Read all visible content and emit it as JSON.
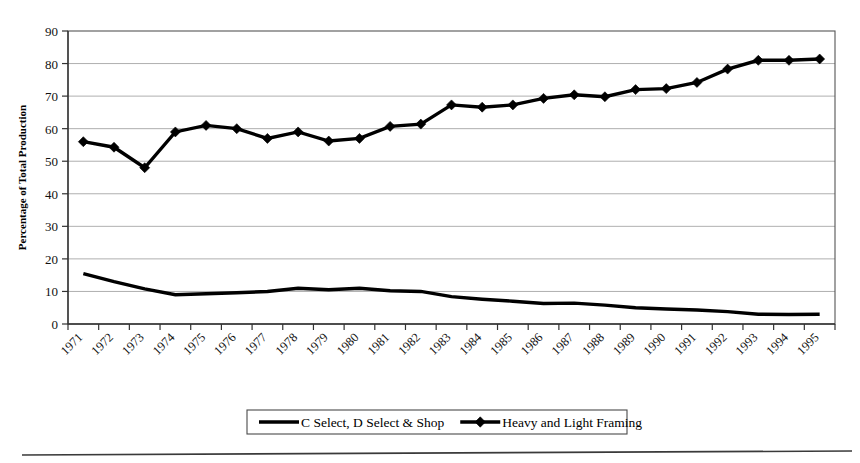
{
  "chart_data": {
    "type": "line",
    "title": "",
    "xlabel": "",
    "ylabel": "Percentage of Total Production",
    "ylim": [
      0,
      90
    ],
    "ytick_step": 10,
    "yticks": [
      0,
      10,
      20,
      30,
      40,
      50,
      60,
      70,
      80,
      90
    ],
    "grid": true,
    "grid_axis": "y",
    "legend_position": "bottom",
    "categories": [
      "1971",
      "1972",
      "1973",
      "1974",
      "1975",
      "1976",
      "1977",
      "1978",
      "1979",
      "1980",
      "1981",
      "1982",
      "1983",
      "1984",
      "1985",
      "1986",
      "1987",
      "1988",
      "1989",
      "1990",
      "1991",
      "1992",
      "1993",
      "1994",
      "1995"
    ],
    "series": [
      {
        "name": "C Select, D Select & Shop",
        "marker": "none",
        "values": [
          15.5,
          13.0,
          10.8,
          9.0,
          9.3,
          9.6,
          10.0,
          11.0,
          10.5,
          11.0,
          10.2,
          10.0,
          8.4,
          7.6,
          7.0,
          6.3,
          6.4,
          5.8,
          5.0,
          4.6,
          4.3,
          3.8,
          3.0,
          2.9,
          3.0
        ]
      },
      {
        "name": "Heavy and Light Framing",
        "marker": "diamond",
        "values": [
          56.0,
          54.3,
          48.0,
          59.0,
          61.0,
          60.0,
          57.0,
          59.0,
          56.2,
          57.0,
          60.7,
          61.4,
          67.3,
          66.6,
          67.3,
          69.3,
          70.4,
          69.8,
          72.0,
          72.3,
          74.2,
          78.3,
          81.0,
          81.0,
          81.4
        ]
      }
    ]
  },
  "axis": {
    "y_title": "Percentage of Total Production",
    "y_tick_labels": [
      "90",
      "80",
      "70",
      "60",
      "50",
      "40",
      "30",
      "20",
      "10",
      "0"
    ],
    "x_tick_labels": [
      "1971",
      "1972",
      "1973",
      "1974",
      "1975",
      "1976",
      "1977",
      "1978",
      "1979",
      "1980",
      "1981",
      "1982",
      "1983",
      "1984",
      "1985",
      "1986",
      "1987",
      "1988",
      "1989",
      "1990",
      "1991",
      "1992",
      "1993",
      "1994",
      "1995"
    ]
  },
  "legend": {
    "entries": [
      {
        "label": "C Select, D Select & Shop",
        "marker": "line"
      },
      {
        "label": "Heavy and Light Framing",
        "marker": "line-diamond"
      }
    ]
  },
  "colors": {
    "series": "#000000",
    "grid": "#9a9a9a",
    "axis": "#333333",
    "background": "#ffffff"
  }
}
